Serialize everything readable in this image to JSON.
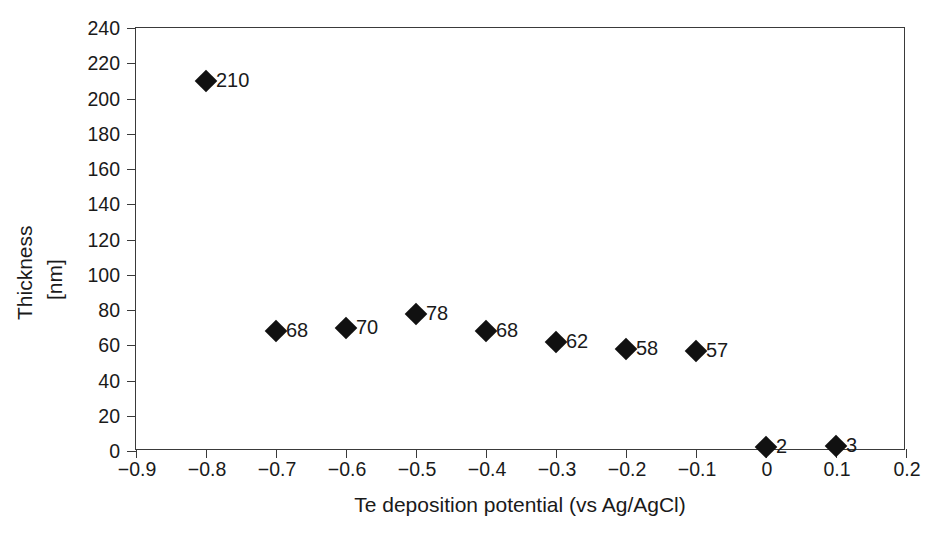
{
  "chart_data": {
    "type": "scatter",
    "title": "",
    "xlabel": "Te deposition potential (vs Ag/AgCl)",
    "ylabel": "Thickness",
    "ylabel_unit": "[nm]",
    "xlim": [
      -0.9,
      0.2
    ],
    "ylim": [
      0,
      240
    ],
    "xtick_step": 0.1,
    "ytick_step": 20,
    "grid": false,
    "legend": false,
    "marker": "filled-diamond",
    "marker_color": "#111111",
    "xticks": [
      "−0.9",
      "−0.8",
      "−0.7",
      "−0.6",
      "−0.5",
      "−0.4",
      "−0.3",
      "−0.2",
      "−0.1",
      "0",
      "0.1",
      "0.2"
    ],
    "xtick_values": [
      -0.9,
      -0.8,
      -0.7,
      -0.6,
      -0.5,
      -0.4,
      -0.3,
      -0.2,
      -0.1,
      0,
      0.1,
      0.2
    ],
    "yticks": [
      "0",
      "20",
      "40",
      "60",
      "80",
      "100",
      "120",
      "140",
      "160",
      "180",
      "200",
      "220",
      "240"
    ],
    "ytick_values": [
      0,
      20,
      40,
      60,
      80,
      100,
      120,
      140,
      160,
      180,
      200,
      220,
      240
    ],
    "x": [
      -0.8,
      -0.7,
      -0.6,
      -0.5,
      -0.4,
      -0.3,
      -0.2,
      -0.1,
      0,
      0.1
    ],
    "values": [
      210,
      68,
      70,
      78,
      68,
      62,
      58,
      57,
      2,
      3
    ],
    "point_labels": [
      "210",
      "68",
      "70",
      "78",
      "68",
      "62",
      "58",
      "57",
      "2",
      "3"
    ]
  }
}
